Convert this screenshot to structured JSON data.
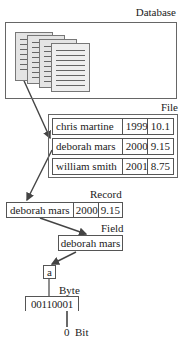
{
  "diagram": {
    "levels": {
      "database": {
        "label": "Database"
      },
      "file": {
        "label": "File",
        "rows": [
          [
            "chris martine",
            "1999",
            "10.1"
          ],
          [
            "deborah mars",
            "2000",
            "9.15"
          ],
          [
            "william smith",
            "2001",
            "8.75"
          ]
        ]
      },
      "record": {
        "label": "Record",
        "cells": [
          "deborah mars",
          "2000",
          "9.15"
        ]
      },
      "field": {
        "label": "Field",
        "value": "deborah mars"
      },
      "byte": {
        "label": "Byte",
        "char": "a",
        "bits": "00110001"
      },
      "bit": {
        "label": "Bit",
        "value": "0"
      }
    },
    "colors": {
      "line": "#444444",
      "page_fill": "#e4e4e4",
      "border": "#666666"
    }
  }
}
